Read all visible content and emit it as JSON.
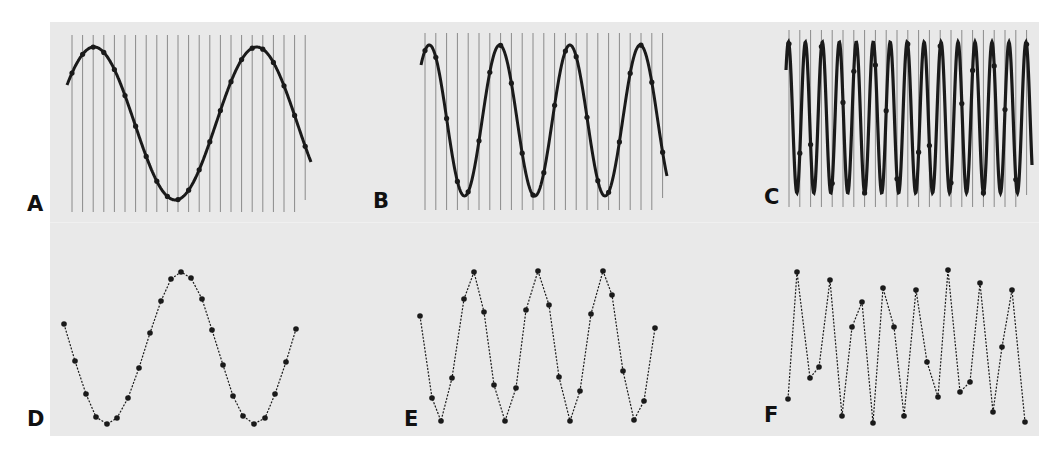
{
  "figure": {
    "panels": [
      {
        "id": "A",
        "label": "A",
        "type": "continuous",
        "cycles": 1.5,
        "description": "Low-frequency sine wave with sampling lines"
      },
      {
        "id": "B",
        "label": "B",
        "type": "continuous",
        "cycles": 3.5,
        "description": "Medium-frequency sine wave with sampling lines"
      },
      {
        "id": "C",
        "label": "C",
        "type": "continuous",
        "cycles": 14.5,
        "description": "High-frequency sine wave with sampling lines"
      },
      {
        "id": "D",
        "label": "D",
        "type": "sampled",
        "description": "Reconstruction from samples of A"
      },
      {
        "id": "E",
        "label": "E",
        "type": "sampled",
        "description": "Reconstruction from samples of B"
      },
      {
        "id": "F",
        "label": "F",
        "type": "sampled",
        "description": "Aliased reconstruction from samples of C"
      }
    ],
    "colors": {
      "background": "#e9e9e9",
      "wave": "#1a1a1a",
      "grid": "#8a8a8a",
      "label": "#111111"
    },
    "sample_lines": {
      "A": {
        "x_start": 72,
        "spacing": 10.6,
        "count": 23,
        "y_top": 35,
        "y_bottom": 212
      },
      "B": {
        "x_start": 425,
        "spacing": 10.8,
        "count": 23,
        "y_top": 33,
        "y_bottom": 210
      },
      "C": {
        "x_start": 789,
        "spacing": 10.8,
        "count": 23,
        "y_top": 30,
        "y_bottom": 207
      }
    },
    "sampled_points": {
      "D": [
        [
          64,
          324
        ],
        [
          75,
          361
        ],
        [
          86,
          394
        ],
        [
          96,
          417
        ],
        [
          107,
          424
        ],
        [
          117,
          418
        ],
        [
          128,
          398
        ],
        [
          139,
          368
        ],
        [
          150,
          333
        ],
        [
          161,
          301
        ],
        [
          171,
          279
        ],
        [
          181,
          272
        ],
        [
          191,
          278
        ],
        [
          202,
          299
        ],
        [
          212,
          330
        ],
        [
          223,
          365
        ],
        [
          233,
          396
        ],
        [
          243,
          416
        ],
        [
          254,
          424
        ],
        [
          265,
          418
        ],
        [
          275,
          394
        ],
        [
          286,
          362
        ],
        [
          296,
          329
        ]
      ],
      "E": [
        [
          420,
          316
        ],
        [
          432,
          398
        ],
        [
          441,
          421
        ],
        [
          452,
          378
        ],
        [
          464,
          299
        ],
        [
          474,
          272
        ],
        [
          484,
          312
        ],
        [
          494,
          385
        ],
        [
          505,
          421
        ],
        [
          516,
          388
        ],
        [
          526,
          310
        ],
        [
          538,
          271
        ],
        [
          549,
          305
        ],
        [
          559,
          377
        ],
        [
          570,
          421
        ],
        [
          580,
          391
        ],
        [
          591,
          314
        ],
        [
          603,
          271
        ],
        [
          612,
          295
        ],
        [
          623,
          371
        ],
        [
          634,
          420
        ],
        [
          644,
          401
        ],
        [
          655,
          328
        ]
      ],
      "F": [
        [
          788,
          399
        ],
        [
          797,
          272
        ],
        [
          810,
          378
        ],
        [
          819,
          367
        ],
        [
          830,
          280
        ],
        [
          842,
          416
        ],
        [
          852,
          327
        ],
        [
          862,
          302
        ],
        [
          873,
          423
        ],
        [
          883,
          288
        ],
        [
          894,
          327
        ],
        [
          904,
          416
        ],
        [
          916,
          290
        ],
        [
          927,
          362
        ],
        [
          938,
          397
        ],
        [
          948,
          270
        ],
        [
          960,
          392
        ],
        [
          970,
          382
        ],
        [
          980,
          283
        ],
        [
          993,
          412
        ],
        [
          1002,
          347
        ],
        [
          1012,
          290
        ],
        [
          1025,
          422
        ]
      ]
    }
  }
}
